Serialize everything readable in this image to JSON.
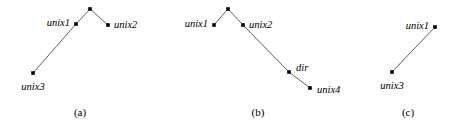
{
  "figure": {
    "width": 454,
    "height": 126,
    "background": "#ffffff",
    "edge_color": "#4d4d4d",
    "node_color": "#000000",
    "text_color": "#000000"
  },
  "panels": [
    {
      "id": "panel-a",
      "caption": "(a)",
      "caption_x": 80,
      "caption_y": 112,
      "nodes": [
        {
          "id": "a-root",
          "label": "",
          "x": 90,
          "y": 9,
          "label_x": 0,
          "label_y": 0,
          "anchor": "none"
        },
        {
          "id": "a-unix1",
          "label": "unix1",
          "x": 76,
          "y": 24,
          "label_x": 70,
          "label_y": 23,
          "anchor": "right"
        },
        {
          "id": "a-unix2",
          "label": "unix2",
          "x": 108,
          "y": 25,
          "label_x": 114,
          "label_y": 25,
          "anchor": "left"
        },
        {
          "id": "a-unix3",
          "label": "unix3",
          "x": 33,
          "y": 73,
          "label_x": 33,
          "label_y": 82,
          "anchor": "below"
        }
      ],
      "edges": [
        {
          "id": "a-edge-unix1-root",
          "from": "a-unix1",
          "to": "a-root"
        },
        {
          "id": "a-edge-root-unix2",
          "from": "a-root",
          "to": "a-unix2"
        },
        {
          "id": "a-edge-unix1-unix3",
          "from": "a-unix1",
          "to": "a-unix3"
        }
      ]
    },
    {
      "id": "panel-b",
      "caption": "(b)",
      "caption_x": 258,
      "caption_y": 112,
      "nodes": [
        {
          "id": "b-root",
          "label": "",
          "x": 228,
          "y": 9,
          "label_x": 0,
          "label_y": 0,
          "anchor": "none"
        },
        {
          "id": "b-unix1",
          "label": "unix1",
          "x": 214,
          "y": 25,
          "label_x": 208,
          "label_y": 24,
          "anchor": "right"
        },
        {
          "id": "b-unix2",
          "label": "unix2",
          "x": 243,
          "y": 25,
          "label_x": 249,
          "label_y": 25,
          "anchor": "left"
        },
        {
          "id": "b-dir",
          "label": "dir",
          "x": 289,
          "y": 72,
          "label_x": 296,
          "label_y": 68,
          "anchor": "left"
        },
        {
          "id": "b-unix4",
          "label": "unix4",
          "x": 310,
          "y": 88,
          "label_x": 317,
          "label_y": 90,
          "anchor": "left"
        }
      ],
      "edges": [
        {
          "id": "b-edge-unix1-root",
          "from": "b-unix1",
          "to": "b-root"
        },
        {
          "id": "b-edge-root-unix2",
          "from": "b-root",
          "to": "b-unix2"
        },
        {
          "id": "b-edge-unix2-dir",
          "from": "b-unix2",
          "to": "b-dir"
        },
        {
          "id": "b-edge-dir-unix4",
          "from": "b-dir",
          "to": "b-unix4"
        }
      ]
    },
    {
      "id": "panel-c",
      "caption": "(c)",
      "caption_x": 408,
      "caption_y": 112,
      "nodes": [
        {
          "id": "c-unix1",
          "label": "unix1",
          "x": 435,
          "y": 27,
          "label_x": 429,
          "label_y": 26,
          "anchor": "right"
        },
        {
          "id": "c-unix3",
          "label": "unix3",
          "x": 392,
          "y": 72,
          "label_x": 392,
          "label_y": 81,
          "anchor": "below"
        }
      ],
      "edges": [
        {
          "id": "c-edge-unix1-unix3",
          "from": "c-unix1",
          "to": "c-unix3"
        }
      ]
    }
  ]
}
